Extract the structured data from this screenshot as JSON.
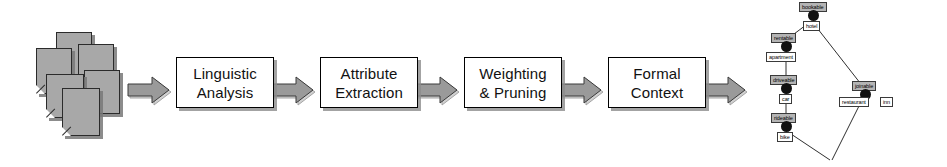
{
  "diagram": {
    "type": "flow-pipeline",
    "colors": {
      "arrow_fill": "#9a9a9a",
      "arrow_stroke": "#3a3a3a",
      "box_fill": "#ffffff",
      "box_stroke": "#000000",
      "document_fill": "#a8a8a8",
      "node_fill": "#111111",
      "attribute_label_fill": "#b4b4b4",
      "object_label_fill": "#ffffff"
    }
  },
  "source": {
    "name": "document-stack",
    "label": "",
    "page_count": 6
  },
  "arrows": [
    {
      "name": "arrow-documents-to-linguistic"
    },
    {
      "name": "arrow-linguistic-to-attribute"
    },
    {
      "name": "arrow-attribute-to-weighting"
    },
    {
      "name": "arrow-weighting-to-formal"
    },
    {
      "name": "arrow-formal-to-lattice"
    }
  ],
  "stages": [
    {
      "id": "linguistic",
      "line1": "Linguistic",
      "line2": "Analysis"
    },
    {
      "id": "attribute",
      "line1": "Attribute",
      "line2": "Extraction"
    },
    {
      "id": "weighting",
      "line1": "Weighting",
      "line2": "& Pruning"
    },
    {
      "id": "formal",
      "line1": "Formal",
      "line2": "Context"
    }
  ],
  "lattice": {
    "name": "concept-lattice",
    "nodes": [
      {
        "id": "top",
        "attribute": "bookable",
        "object": "hotel"
      },
      {
        "id": "rentable",
        "attribute": "rentable",
        "object": "apartment"
      },
      {
        "id": "driveable",
        "attribute": "driveable",
        "object": "car"
      },
      {
        "id": "rideable",
        "attribute": "rideable",
        "object": "bike"
      },
      {
        "id": "joinable",
        "attribute": "joinable",
        "object": "restaurant",
        "object2": "inn"
      },
      {
        "id": "bottom",
        "attribute": "",
        "object": ""
      }
    ],
    "edges": [
      {
        "from": "top",
        "to": "rentable"
      },
      {
        "from": "top",
        "to": "joinable"
      },
      {
        "from": "rentable",
        "to": "driveable"
      },
      {
        "from": "driveable",
        "to": "rideable"
      },
      {
        "from": "rideable",
        "to": "bottom"
      },
      {
        "from": "joinable",
        "to": "bottom"
      }
    ]
  }
}
